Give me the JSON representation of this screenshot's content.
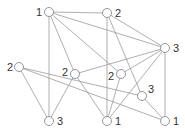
{
  "graph": {
    "nodes": [
      {
        "id": "A",
        "label": "1",
        "x": 49,
        "y": 12,
        "lx": 36,
        "ly": 16
      },
      {
        "id": "B",
        "label": "2",
        "x": 107,
        "y": 13,
        "lx": 115,
        "ly": 17
      },
      {
        "id": "C",
        "label": "3",
        "x": 165,
        "y": 48,
        "lx": 173,
        "ly": 52
      },
      {
        "id": "D",
        "label": "2",
        "x": 19,
        "y": 67,
        "lx": 7,
        "ly": 71
      },
      {
        "id": "E",
        "label": "2",
        "x": 75,
        "y": 74,
        "lx": 62,
        "ly": 76
      },
      {
        "id": "F",
        "label": "2",
        "x": 121,
        "y": 74,
        "lx": 108,
        "ly": 80
      },
      {
        "id": "G",
        "label": "3",
        "x": 142,
        "y": 96,
        "lx": 148,
        "ly": 93
      },
      {
        "id": "H",
        "label": "3",
        "x": 49,
        "y": 121,
        "lx": 57,
        "ly": 125
      },
      {
        "id": "I",
        "label": "1",
        "x": 107,
        "y": 121,
        "lx": 115,
        "ly": 125
      },
      {
        "id": "J",
        "label": "1",
        "x": 165,
        "y": 121,
        "lx": 173,
        "ly": 125
      }
    ],
    "edges": [
      [
        "A",
        "B"
      ],
      [
        "A",
        "C"
      ],
      [
        "A",
        "F"
      ],
      [
        "A",
        "E"
      ],
      [
        "A",
        "H"
      ],
      [
        "B",
        "C"
      ],
      [
        "B",
        "I"
      ],
      [
        "B",
        "G"
      ],
      [
        "C",
        "F"
      ],
      [
        "C",
        "I"
      ],
      [
        "C",
        "J"
      ],
      [
        "D",
        "H"
      ],
      [
        "D",
        "G"
      ],
      [
        "D",
        "J"
      ],
      [
        "E",
        "H"
      ],
      [
        "E",
        "I"
      ],
      [
        "E",
        "C"
      ],
      [
        "F",
        "I"
      ],
      [
        "G",
        "J"
      ]
    ]
  }
}
